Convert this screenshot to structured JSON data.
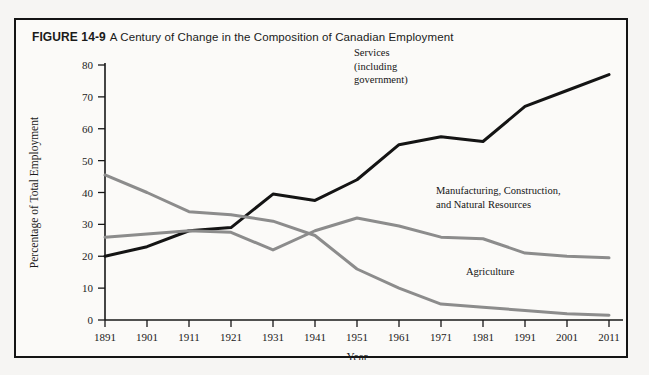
{
  "figure": {
    "number": "FIGURE 14-9",
    "title": "A Century of Change in the Composition of Canadian Employment"
  },
  "chart_data": {
    "type": "line",
    "title": "A Century of Change in the Composition of Canadian Employment",
    "xlabel": "Year",
    "ylabel": "Percentage of Total Employment",
    "xlim": [
      1891,
      2011
    ],
    "ylim": [
      0,
      80
    ],
    "yticks": [
      0,
      10,
      20,
      30,
      40,
      50,
      60,
      70,
      80
    ],
    "grid": false,
    "legend_position": "inline-annotations",
    "categories": [
      1891,
      1901,
      1911,
      1921,
      1931,
      1941,
      1951,
      1961,
      1971,
      1981,
      1991,
      2001,
      2011
    ],
    "tick_labels": [
      "1891",
      "1901",
      "1911",
      "1921",
      "1931",
      "1941",
      "1951",
      "1961",
      "1971",
      "1981",
      "1991",
      "2001",
      "2011"
    ],
    "series": [
      {
        "name": "Services (including government)",
        "label_lines": [
          "Services",
          "(including",
          "government)"
        ],
        "color": "#141414",
        "width": 3.0,
        "values": [
          20,
          23,
          28,
          29,
          39.5,
          37.5,
          44,
          55,
          57.5,
          56,
          67,
          72,
          77
        ]
      },
      {
        "name": "Manufacturing, Construction, and Natural Resources",
        "label_lines": [
          "Manufacturing, Construction,",
          "and Natural Resources"
        ],
        "color": "#8c8c8c",
        "width": 3.0,
        "values": [
          26,
          27,
          28,
          27.5,
          22,
          28,
          32,
          29.5,
          26,
          25.5,
          21,
          20,
          19.5
        ]
      },
      {
        "name": "Agriculture",
        "label_lines": [
          "Agriculture"
        ],
        "color": "#8c8c8c",
        "width": 3.0,
        "values": [
          45.5,
          40,
          34,
          33,
          31,
          26.5,
          16,
          10,
          5,
          4,
          3,
          2,
          1.5
        ]
      }
    ]
  },
  "annotations": {
    "services": {
      "lines": [
        "Services",
        "(including",
        "government)"
      ]
    },
    "manufacturing": {
      "lines": [
        "Manufacturing, Construction,",
        "and Natural Resources"
      ]
    },
    "agriculture": {
      "lines": [
        "Agriculture"
      ]
    }
  }
}
